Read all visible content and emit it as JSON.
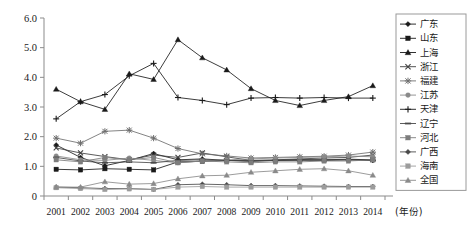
{
  "chart_data": {
    "type": "line",
    "title": "",
    "xlabel": "(年份)",
    "ylabel": "",
    "ylim": [
      0,
      6.0
    ],
    "yticks": [
      "0",
      "1.0",
      "2.0",
      "3.0",
      "4.0",
      "5.0",
      "6.0"
    ],
    "ytick_values": [
      0,
      1.0,
      2.0,
      3.0,
      4.0,
      5.0,
      6.0
    ],
    "grid": false,
    "legend_position": "right",
    "categories": [
      "2001",
      "2002",
      "2003",
      "2004",
      "2005",
      "2006",
      "2007",
      "2008",
      "2009",
      "2010",
      "2011",
      "2012",
      "2013",
      "2014"
    ],
    "series": [
      {
        "name": "广东",
        "marker": "diamond",
        "color": "#1a1a1a",
        "values": [
          1.72,
          1.3,
          1.02,
          1.2,
          1.43,
          1.22,
          1.25,
          1.2,
          1.18,
          1.2,
          1.22,
          1.2,
          1.22,
          1.2
        ]
      },
      {
        "name": "山东",
        "marker": "square",
        "color": "#1a1a1a",
        "values": [
          0.9,
          0.88,
          0.92,
          0.9,
          0.88,
          1.15,
          1.17,
          1.2,
          1.18,
          1.2,
          1.22,
          1.22,
          1.24,
          1.22
        ]
      },
      {
        "name": "上海",
        "marker": "triangle",
        "color": "#1a1a1a",
        "values": [
          3.6,
          3.18,
          2.92,
          4.12,
          3.93,
          5.27,
          4.66,
          4.25,
          3.62,
          3.22,
          3.05,
          3.22,
          3.35,
          3.72
        ]
      },
      {
        "name": "浙江",
        "marker": "x",
        "color": "#3f3f3f",
        "values": [
          1.62,
          1.45,
          1.33,
          1.22,
          1.38,
          1.3,
          1.45,
          1.32,
          1.2,
          1.22,
          1.25,
          1.28,
          1.3,
          1.38
        ]
      },
      {
        "name": "福建",
        "marker": "star",
        "color": "#6e6e6e",
        "values": [
          1.95,
          1.78,
          2.18,
          2.22,
          1.95,
          1.6,
          1.42,
          1.35,
          1.28,
          1.3,
          1.32,
          1.34,
          1.38,
          1.48
        ]
      },
      {
        "name": "江苏",
        "marker": "circle",
        "color": "#8a8a8a",
        "values": [
          1.35,
          1.22,
          1.2,
          1.28,
          1.2,
          1.12,
          1.18,
          1.22,
          1.25,
          1.28,
          1.3,
          1.32,
          1.35,
          1.32
        ]
      },
      {
        "name": "天津",
        "marker": "plus",
        "color": "#1a1a1a",
        "values": [
          2.6,
          3.18,
          3.42,
          4.05,
          4.47,
          3.32,
          3.22,
          3.08,
          3.3,
          3.32,
          3.3,
          3.32,
          3.3,
          3.3
        ]
      },
      {
        "name": "辽宁",
        "marker": "dash",
        "color": "#4a4a4a",
        "values": [
          1.3,
          1.18,
          1.12,
          1.15,
          1.12,
          1.2,
          1.22,
          1.2,
          1.18,
          1.2,
          1.2,
          1.22,
          1.22,
          1.2
        ]
      },
      {
        "name": "河北",
        "marker": "square",
        "color": "#7d7d7d",
        "values": [
          1.22,
          1.15,
          1.3,
          1.22,
          1.3,
          1.12,
          1.18,
          1.15,
          1.12,
          1.15,
          1.15,
          1.18,
          1.18,
          1.22
        ]
      },
      {
        "name": "广西",
        "marker": "diamond",
        "color": "#4a4a4a",
        "values": [
          0.3,
          0.28,
          0.25,
          0.25,
          0.22,
          0.38,
          0.4,
          0.38,
          0.35,
          0.35,
          0.34,
          0.33,
          0.32,
          0.32
        ]
      },
      {
        "name": "海南",
        "marker": "square",
        "color": "#9c9c9c",
        "values": [
          0.28,
          0.25,
          0.22,
          0.24,
          0.22,
          0.3,
          0.32,
          0.3,
          0.3,
          0.3,
          0.3,
          0.3,
          0.3,
          0.3
        ]
      },
      {
        "name": "全国",
        "marker": "triangle",
        "color": "#8a8a8a",
        "values": [
          0.3,
          0.3,
          0.48,
          0.4,
          0.42,
          0.58,
          0.68,
          0.7,
          0.8,
          0.85,
          0.9,
          0.92,
          0.85,
          0.7
        ]
      }
    ]
  }
}
